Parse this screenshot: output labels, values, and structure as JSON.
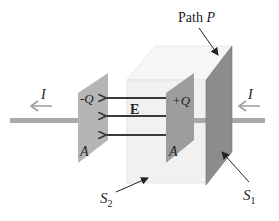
{
  "diagram": {
    "title_label": "Path",
    "title_var": "P",
    "current_left": "I",
    "current_right": "I",
    "neg_charge": "-Q",
    "pos_charge": "+Q",
    "field": "E",
    "area_left": "A",
    "area_right": "A",
    "surface2_base": "S",
    "surface2_sub": "2",
    "surface1_base": "S",
    "surface1_sub": "1"
  },
  "colors": {
    "wire": "#a9a9a9",
    "plate_left": "#b3b3b3",
    "plate_right": "#9c9c9c",
    "surface1": "#8a8a8a",
    "box_front": "#f2f2f2",
    "box_top": "#f7f7f7",
    "arrow": "#3a3a3a",
    "current_arrow": "#a0a0a0"
  }
}
